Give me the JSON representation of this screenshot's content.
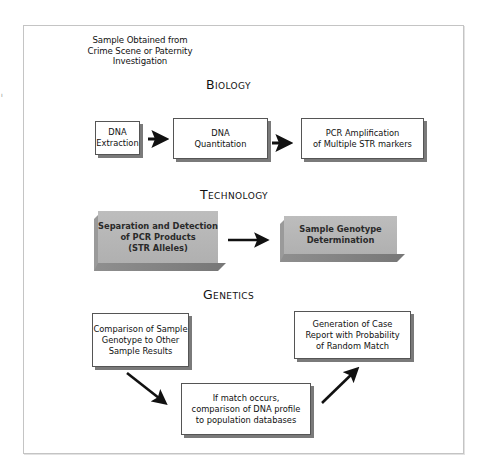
{
  "stray_mark": "ı",
  "intro": {
    "lines": [
      "Sample Obtained from",
      "Crime Scene or Paternity",
      "Investigation"
    ]
  },
  "sections": {
    "biology": {
      "heading": "Biology",
      "steps": [
        {
          "lines": [
            "DNA",
            "Extraction"
          ]
        },
        {
          "lines": [
            "DNA",
            "Quantitation"
          ]
        },
        {
          "lines": [
            "PCR Amplification",
            "of Multiple STR markers"
          ]
        }
      ]
    },
    "technology": {
      "heading": "Technology",
      "steps": [
        {
          "lines": [
            "Separation and Detection",
            "of PCR Products",
            "(STR Alleles)"
          ]
        },
        {
          "lines": [
            "Sample Genotype",
            "Determination"
          ]
        }
      ]
    },
    "genetics": {
      "heading": "Genetics",
      "steps": [
        {
          "lines": [
            "Comparison of Sample",
            "Genotype to Other",
            "Sample Results"
          ]
        },
        {
          "lines": [
            "If match occurs,",
            "comparison of DNA profile",
            "to population databases"
          ]
        },
        {
          "lines": [
            "Generation of Case",
            "Report with Probability",
            "of Random Match"
          ]
        }
      ]
    }
  },
  "colors": {
    "frame_border": "#c4c4c4",
    "box_border": "#555555",
    "box_shadow": "#7a7a7a",
    "gray_box_fill": "#b5b5b5",
    "arrow": "#111111"
  }
}
